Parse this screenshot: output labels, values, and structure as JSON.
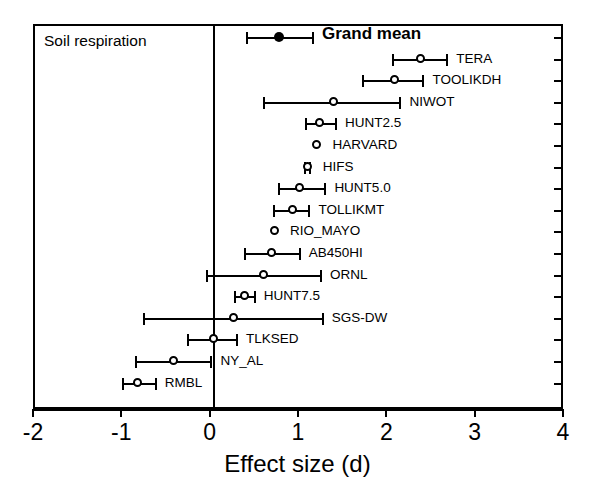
{
  "chart_data": {
    "type": "scatter",
    "title": "",
    "panel_label": "Soil respiration",
    "xlabel": "Effect size (d)",
    "ylabel": "",
    "xlim": [
      -2,
      4
    ],
    "xticks": [
      -2,
      -1,
      0,
      1,
      2,
      3,
      4
    ],
    "xticklabels": [
      "-2",
      "-1",
      "0",
      "1",
      "2",
      "3",
      "4"
    ],
    "grid": false,
    "legend": "none",
    "reference_line": 0,
    "annotations": [
      "vertical reference line at effect size = 0"
    ],
    "series": [
      {
        "name": "Grand mean",
        "marker": "filled-circle",
        "bold_label": true,
        "mean": 0.79,
        "ci_low": 0.42,
        "ci_high": 1.17
      },
      {
        "name": "TERA",
        "marker": "open-circle",
        "bold_label": false,
        "mean": 2.39,
        "ci_low": 2.08,
        "ci_high": 2.69
      },
      {
        "name": "TOOLIKDH",
        "marker": "open-circle",
        "bold_label": false,
        "mean": 2.1,
        "ci_low": 1.74,
        "ci_high": 2.42
      },
      {
        "name": "NIWOT",
        "marker": "open-circle",
        "bold_label": false,
        "mean": 1.41,
        "ci_low": 0.62,
        "ci_high": 2.16
      },
      {
        "name": "HUNT2.5",
        "marker": "open-circle",
        "bold_label": false,
        "mean": 1.25,
        "ci_low": 1.09,
        "ci_high": 1.43
      },
      {
        "name": "HARVARD",
        "marker": "open-circle",
        "bold_label": false,
        "mean": 1.22,
        "ci_low": 1.22,
        "ci_high": 1.22
      },
      {
        "name": "HIFS",
        "marker": "open-circle",
        "bold_label": false,
        "mean": 1.11,
        "ci_low": 1.08,
        "ci_high": 1.14
      },
      {
        "name": "HUNT5.0",
        "marker": "open-circle",
        "bold_label": false,
        "mean": 1.02,
        "ci_low": 0.79,
        "ci_high": 1.31
      },
      {
        "name": "TOLLIKMT",
        "marker": "open-circle",
        "bold_label": false,
        "mean": 0.94,
        "ci_low": 0.73,
        "ci_high": 1.13
      },
      {
        "name": "RIO_MAYO",
        "marker": "open-circle",
        "bold_label": false,
        "mean": 0.74,
        "ci_low": 0.74,
        "ci_high": 0.74
      },
      {
        "name": "AB450HI",
        "marker": "open-circle",
        "bold_label": false,
        "mean": 0.71,
        "ci_low": 0.4,
        "ci_high": 1.02
      },
      {
        "name": "ORNL",
        "marker": "open-circle",
        "bold_label": false,
        "mean": 0.62,
        "ci_low": -0.03,
        "ci_high": 1.26
      },
      {
        "name": "HUNT7.5",
        "marker": "open-circle",
        "bold_label": false,
        "mean": 0.4,
        "ci_low": 0.29,
        "ci_high": 0.51
      },
      {
        "name": "SGS-DW",
        "marker": "open-circle",
        "bold_label": false,
        "mean": 0.27,
        "ci_low": -0.74,
        "ci_high": 1.28
      },
      {
        "name": "TLKSED",
        "marker": "open-circle",
        "bold_label": false,
        "mean": 0.05,
        "ci_low": -0.24,
        "ci_high": 0.31
      },
      {
        "name": "NY_AL",
        "marker": "open-circle",
        "bold_label": false,
        "mean": -0.4,
        "ci_low": -0.83,
        "ci_high": 0.02
      },
      {
        "name": "RMBL",
        "marker": "open-circle",
        "bold_label": false,
        "mean": -0.81,
        "ci_low": -0.98,
        "ci_high": -0.61
      }
    ]
  }
}
